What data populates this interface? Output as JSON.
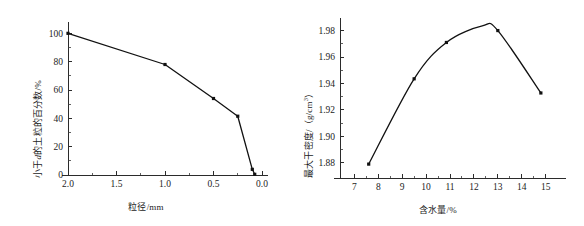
{
  "figure": {
    "background_color": "#ffffff",
    "line_color": "#111111",
    "axis_color": "#2b2b2b",
    "text_color": "#1c1c1c"
  },
  "chart_data": [
    {
      "type": "line",
      "panel": "left",
      "title": "",
      "xlabel": "粒径/mm",
      "ylabel_prefix": "小于",
      "ylabel_italic": "d",
      "ylabel_suffix": "的土粒的百分数/%",
      "ylabel": "小于d的土粒的百分数/%",
      "x": [
        2.0,
        1.0,
        0.5,
        0.25,
        0.1,
        0.075
      ],
      "y": [
        100,
        78,
        54,
        41.5,
        4,
        0.5
      ],
      "xlim": [
        2.0,
        0.0
      ],
      "x_reversed": true,
      "ylim": [
        0,
        108
      ],
      "xticks": [
        2.0,
        1.5,
        1.0,
        0.5,
        0.0
      ],
      "xticklabels": [
        "2.0",
        "1.5",
        "1.0",
        "0.5",
        "0.0"
      ],
      "yticks": [
        0,
        20,
        40,
        60,
        80,
        100
      ],
      "yticklabels": [
        "0",
        "20",
        "40",
        "60",
        "80",
        "100"
      ],
      "grid": false,
      "legend": "none",
      "marker": "square",
      "smooth": false
    },
    {
      "type": "line",
      "panel": "right",
      "title": "",
      "xlabel": "含水量/%",
      "ylabel_prefix": "最大干密度/（g/cm",
      "ylabel_sup": "3",
      "ylabel_suffix": "）",
      "ylabel": "最大干密度/（g/cm3）",
      "x": [
        7.6,
        9.5,
        10.85,
        13.0,
        14.8
      ],
      "y": [
        1.879,
        1.9435,
        1.971,
        1.98,
        1.9328
      ],
      "xlim": [
        6.4,
        15.6
      ],
      "ylim": [
        1.8685,
        1.9895
      ],
      "xticks": [
        7,
        8,
        9,
        10,
        11,
        12,
        13,
        14,
        15
      ],
      "xticklabels": [
        "7",
        "8",
        "9",
        "10",
        "11",
        "12",
        "13",
        "14",
        "15"
      ],
      "yticks": [
        1.88,
        1.9,
        1.92,
        1.94,
        1.96,
        1.98
      ],
      "yticklabels": [
        "1.88",
        "1.90",
        "1.92",
        "1.94",
        "1.96",
        "1.98"
      ],
      "grid": false,
      "legend": "none",
      "marker": "square",
      "smooth": true,
      "peak_value": 1.9835,
      "peak_x": 12.35
    }
  ]
}
